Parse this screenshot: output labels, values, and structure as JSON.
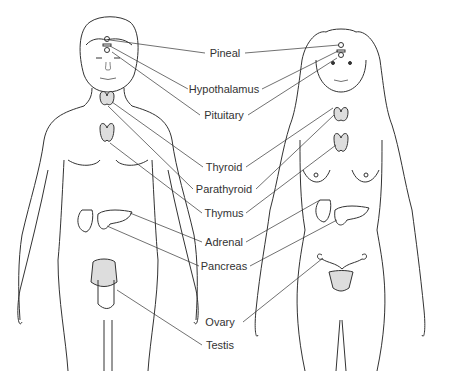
{
  "diagram": {
    "figures": [
      "male",
      "female"
    ],
    "labels": [
      {
        "id": "pineal",
        "text": "Pineal",
        "x": 225,
        "y": 53
      },
      {
        "id": "hypothalamus",
        "text": "Hypothalamus",
        "x": 224,
        "y": 89
      },
      {
        "id": "pituitary",
        "text": "Pituitary",
        "x": 224,
        "y": 115
      },
      {
        "id": "thyroid",
        "text": "Thyroid",
        "x": 224,
        "y": 167
      },
      {
        "id": "parathyroid",
        "text": "Parathyroid",
        "x": 224,
        "y": 189
      },
      {
        "id": "thymus",
        "text": "Thymus",
        "x": 224,
        "y": 213
      },
      {
        "id": "adrenal",
        "text": "Adrenal",
        "x": 224,
        "y": 242
      },
      {
        "id": "pancreas",
        "text": "Pancreas",
        "x": 224,
        "y": 266
      },
      {
        "id": "ovary",
        "text": "Ovary",
        "x": 220,
        "y": 322
      },
      {
        "id": "testis",
        "text": "Testis",
        "x": 220,
        "y": 345
      }
    ],
    "colors": {
      "line": "#333333",
      "text": "#333333",
      "gland": "#999999",
      "background": "#ffffff"
    }
  }
}
